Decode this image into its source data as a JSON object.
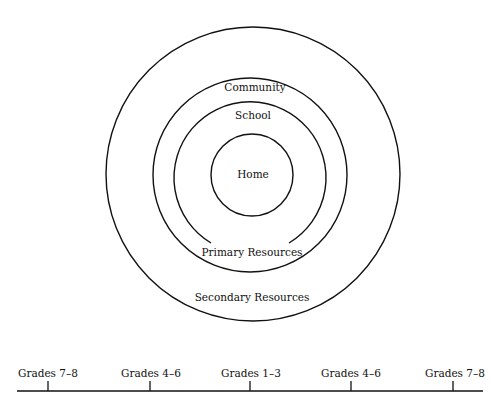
{
  "diagram": {
    "type": "concentric-circles",
    "rings": [
      {
        "id": "secondary",
        "label": "Secondary Resources"
      },
      {
        "id": "community",
        "label": "Community"
      },
      {
        "id": "school",
        "label": "School",
        "bottom_label": "Primary Resources"
      },
      {
        "id": "home",
        "label": "Home"
      }
    ]
  },
  "timeline": {
    "ticks": [
      "Grades 7–8",
      "Grades 4–6",
      "Grades 1–3",
      "Grades 4–6",
      "Grades 7–8"
    ]
  },
  "colors": {
    "ink": "#111111",
    "background": "#ffffff"
  }
}
